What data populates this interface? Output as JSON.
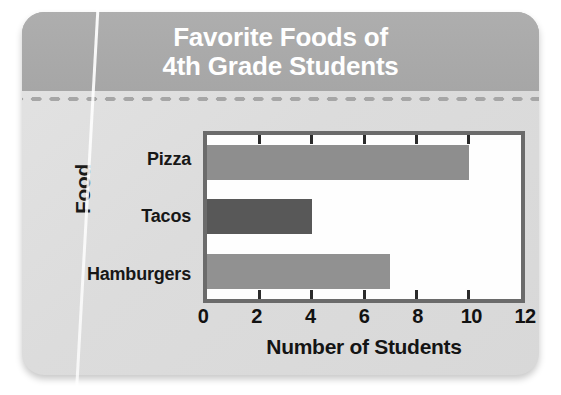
{
  "banner": {
    "title": "Favorite Foods of\n4th Grade Students"
  },
  "chart_data": {
    "type": "bar",
    "orientation": "horizontal",
    "title": "Favorite Foods of 4th Grade Students",
    "categories": [
      "Pizza",
      "Tacos",
      "Hamburgers"
    ],
    "values": [
      10,
      4,
      7
    ],
    "xlabel": "Number of Students",
    "ylabel": "Food",
    "xlim": [
      0,
      12
    ],
    "xticks": [
      0,
      2,
      4,
      6,
      8,
      10,
      12
    ],
    "xtick_labels": [
      "0",
      "2",
      "4",
      "6",
      "8",
      "10",
      "12"
    ],
    "grid": true,
    "legend": false,
    "bar_colors": [
      "#8e8e8e",
      "#585858",
      "#919191"
    ]
  },
  "colors": {
    "banner_background": "#a9a9a9",
    "banner_text": "#ffffff",
    "card_background": "#dedede",
    "plot_border": "#6b6b6b",
    "plot_background": "#fefefe",
    "tick_color": "#2b2b2b",
    "label_text": "#171717"
  }
}
